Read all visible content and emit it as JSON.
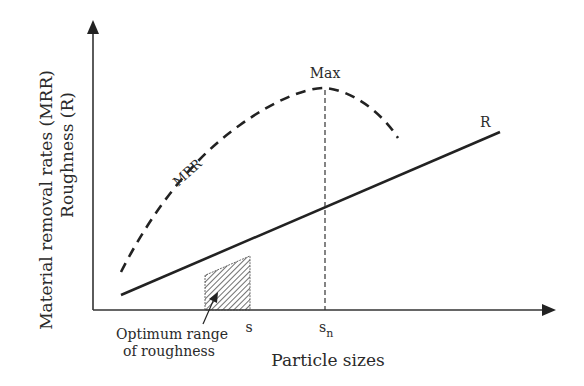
{
  "diagram": {
    "y_axis_label_line1": "Material removal rates (MRR)",
    "y_axis_label_line2": "Roughness (R)",
    "x_axis_label": "Particle sizes",
    "curve_mrr_label": "MRR",
    "line_r_label": "R",
    "max_label": "Max",
    "tick_s": "s",
    "tick_sn_base": "s",
    "tick_sn_sub": "n",
    "annotation_line1": "Optimum range",
    "annotation_line2": "of roughness",
    "colors": {
      "line": "#222222",
      "text": "#2a2a2a",
      "background": "#ffffff"
    }
  }
}
